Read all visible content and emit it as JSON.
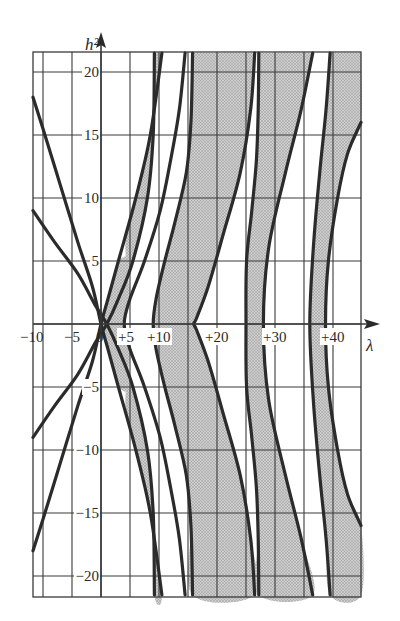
{
  "chart_data": {
    "type": "line",
    "title": "",
    "xlabel": "λ",
    "ylabel": "h²",
    "xlim": [
      -12,
      45
    ],
    "ylim": [
      -21.5,
      21.5
    ],
    "grid": true,
    "legend": null,
    "x_ticks": [
      -10,
      -5,
      0,
      5,
      10,
      15,
      20,
      25,
      30,
      35,
      40
    ],
    "x_tick_labels": [
      "−10",
      "−5",
      "0",
      "+5",
      "+10",
      "",
      "+20",
      "",
      "+30",
      "",
      "+40"
    ],
    "y_ticks": [
      -20,
      -15,
      -10,
      -5,
      0,
      5,
      10,
      15,
      20
    ],
    "y_tick_labels": [
      "−20",
      "−15",
      "−10",
      "−5",
      "",
      "5",
      "10",
      "15",
      "20"
    ],
    "shading": "stable regions (stippled gray) between paired characteristic curves",
    "fill_color": "#bdbdbd",
    "line_color": "#2b2b2b",
    "stable_regions": [
      {
        "name": "region-0-1",
        "left": [
          [
            1.2,
            0
          ],
          [
            2.2,
            5
          ],
          [
            4.5,
            10
          ]
        ],
        "right": [
          [
            1.2,
            0
          ],
          [
            2.6,
            -5
          ],
          [
            5.5,
            -10
          ]
        ]
      },
      {
        "name": "region-1-4",
        "note": "between a1/b1 and b2/a2 curves"
      },
      {
        "name": "region-4-9"
      },
      {
        "name": "region-9-16"
      },
      {
        "name": "region-16-25"
      }
    ],
    "series": [
      {
        "name": "a0",
        "points": [
          [
            -12,
            18
          ],
          [
            -10,
            15.5
          ],
          [
            -7,
            11
          ],
          [
            -4,
            6.5
          ],
          [
            -1.5,
            3
          ],
          [
            0,
            0
          ],
          [
            1.2,
            -2
          ],
          [
            3,
            -5
          ],
          [
            6,
            -10
          ],
          [
            8.5,
            -15
          ],
          [
            10.5,
            -21.5
          ]
        ]
      },
      {
        "name": "a0-mirror",
        "points": [
          [
            -12,
            -18
          ],
          [
            -10,
            -15.5
          ],
          [
            -7,
            -11
          ],
          [
            -4,
            -6.5
          ],
          [
            -1.5,
            -3
          ],
          [
            0,
            0
          ],
          [
            1.2,
            2
          ],
          [
            3,
            5
          ],
          [
            6,
            10
          ],
          [
            8.5,
            15
          ],
          [
            10.5,
            21.5
          ]
        ]
      },
      {
        "name": "b1",
        "points": [
          [
            -12,
            9
          ],
          [
            -8,
            6.5
          ],
          [
            -4,
            4
          ],
          [
            -1,
            1.5
          ],
          [
            1,
            0
          ],
          [
            3,
            -2
          ],
          [
            5.5,
            -5
          ],
          [
            8,
            -10
          ],
          [
            9,
            -15
          ],
          [
            9.2,
            -21.5
          ]
        ]
      },
      {
        "name": "a1",
        "points": [
          [
            -12,
            -9
          ],
          [
            -8,
            -6.5
          ],
          [
            -4,
            -4
          ],
          [
            -1,
            -1.5
          ],
          [
            1,
            0
          ],
          [
            3,
            2
          ],
          [
            5.5,
            5
          ],
          [
            8,
            10
          ],
          [
            9,
            15
          ],
          [
            9.2,
            21.5
          ]
        ]
      },
      {
        "name": "b2",
        "points": [
          [
            14.5,
            21.5
          ],
          [
            13.5,
            17
          ],
          [
            12,
            13
          ],
          [
            10.2,
            9
          ],
          [
            7.5,
            5
          ],
          [
            5,
            2
          ],
          [
            4,
            0
          ],
          [
            5,
            -2
          ],
          [
            7.5,
            -5
          ],
          [
            10.2,
            -9
          ],
          [
            12,
            -13
          ],
          [
            13.5,
            -17
          ],
          [
            14.5,
            -21.5
          ]
        ]
      },
      {
        "name": "a2",
        "points": [
          [
            15.8,
            21.5
          ],
          [
            15.5,
            16
          ],
          [
            14.7,
            12
          ],
          [
            12.7,
            8
          ],
          [
            11,
            5
          ],
          [
            9.5,
            2
          ],
          [
            9,
            0
          ],
          [
            9.5,
            -2
          ],
          [
            11,
            -5
          ],
          [
            12.7,
            -8
          ],
          [
            14.7,
            -12
          ],
          [
            15.5,
            -16
          ],
          [
            15.8,
            -21.5
          ]
        ]
      },
      {
        "name": "b3",
        "points": [
          [
            26.5,
            21.5
          ],
          [
            25.8,
            17
          ],
          [
            24,
            12
          ],
          [
            21,
            7
          ],
          [
            18.5,
            3
          ],
          [
            16.5,
            0.5
          ],
          [
            16,
            0
          ],
          [
            16.5,
            -0.5
          ],
          [
            18.5,
            -3
          ],
          [
            21,
            -7
          ],
          [
            24,
            -12
          ],
          [
            25.8,
            -17
          ],
          [
            26.5,
            -21.5
          ]
        ]
      },
      {
        "name": "a3",
        "points": [
          [
            27.2,
            21.5
          ],
          [
            27.1,
            17
          ],
          [
            26.8,
            13
          ],
          [
            26,
            9
          ],
          [
            25.1,
            5
          ],
          [
            25,
            0
          ],
          [
            25.1,
            -5
          ],
          [
            26,
            -9
          ],
          [
            26.8,
            -13
          ],
          [
            27.1,
            -17
          ],
          [
            27.2,
            -21.5
          ]
        ]
      },
      {
        "name": "b4",
        "points": [
          [
            36.5,
            21.5
          ],
          [
            34.5,
            17
          ],
          [
            31.8,
            12
          ],
          [
            28.9,
            6
          ],
          [
            28,
            0
          ],
          [
            28.9,
            -6
          ],
          [
            31.8,
            -12
          ],
          [
            34.5,
            -17
          ],
          [
            36.5,
            -21.5
          ]
        ]
      },
      {
        "name": "a4",
        "points": [
          [
            39.5,
            21.5
          ],
          [
            38.8,
            17
          ],
          [
            37.7,
            12
          ],
          [
            36.6,
            6
          ],
          [
            36,
            0
          ],
          [
            36.6,
            -6
          ],
          [
            37.7,
            -12
          ],
          [
            38.8,
            -17
          ],
          [
            39.5,
            -21.5
          ]
        ]
      },
      {
        "name": "b5",
        "points": [
          [
            45,
            16
          ],
          [
            42.5,
            13.5
          ],
          [
            40.8,
            10
          ],
          [
            39.2,
            5
          ],
          [
            38.7,
            0
          ],
          [
            39.2,
            -5
          ],
          [
            40.8,
            -10
          ],
          [
            42.5,
            -13.5
          ],
          [
            45,
            -16
          ]
        ]
      }
    ],
    "fills": [
      {
        "name": "fill-1",
        "left": "a0-mirror",
        "right": "a1",
        "polygon": [
          [
            0,
            0
          ],
          [
            1.2,
            2
          ],
          [
            3,
            5
          ],
          [
            5.5,
            5
          ],
          [
            3,
            2
          ],
          [
            1,
            0
          ],
          [
            3,
            -2
          ],
          [
            5.5,
            -5
          ],
          [
            3,
            -5
          ],
          [
            1.2,
            -2
          ]
        ]
      },
      {
        "name": "fill-2",
        "polygon": [
          [
            9.2,
            21.5
          ],
          [
            9,
            15
          ],
          [
            8,
            10
          ],
          [
            5.5,
            5
          ],
          [
            3,
            2
          ],
          [
            1,
            0
          ],
          [
            3,
            -2
          ],
          [
            5.5,
            -5
          ],
          [
            8,
            -10
          ],
          [
            9,
            -15
          ],
          [
            9.2,
            -21.5
          ],
          [
            10.5,
            -21.5
          ],
          [
            8.5,
            -15
          ],
          [
            6,
            -10
          ],
          [
            4.2,
            -6.5
          ],
          [
            5,
            -2
          ],
          [
            4,
            0
          ],
          [
            5,
            2
          ],
          [
            4.2,
            6.5
          ],
          [
            6,
            10
          ],
          [
            8.5,
            15
          ],
          [
            10.5,
            21.5
          ]
        ]
      },
      {
        "name": "fill-3",
        "polygon": [
          [
            15.8,
            21.5
          ],
          [
            15.5,
            16
          ],
          [
            14.7,
            12
          ],
          [
            12.7,
            8
          ],
          [
            11,
            5
          ],
          [
            9.5,
            2
          ],
          [
            9,
            0
          ],
          [
            9.5,
            -2
          ],
          [
            11,
            -5
          ],
          [
            12.7,
            -8
          ],
          [
            14.7,
            -12
          ],
          [
            15.5,
            -16
          ],
          [
            15.8,
            -21.5
          ],
          [
            26.5,
            -21.5
          ],
          [
            25.8,
            -17
          ],
          [
            24,
            -12
          ],
          [
            21,
            -7
          ],
          [
            18.5,
            -3
          ],
          [
            16.5,
            -0.5
          ],
          [
            16,
            0
          ],
          [
            16.5,
            0.5
          ],
          [
            18.5,
            3
          ],
          [
            21,
            7
          ],
          [
            24,
            12
          ],
          [
            25.8,
            17
          ],
          [
            26.5,
            21.5
          ]
        ]
      },
      {
        "name": "fill-4",
        "polygon": [
          [
            27.2,
            21.5
          ],
          [
            27.1,
            17
          ],
          [
            26.8,
            13
          ],
          [
            26,
            9
          ],
          [
            25.1,
            5
          ],
          [
            25,
            0
          ],
          [
            25.1,
            -5
          ],
          [
            26,
            -9
          ],
          [
            26.8,
            -13
          ],
          [
            27.1,
            -17
          ],
          [
            27.2,
            -21.5
          ],
          [
            36.5,
            -21.5
          ],
          [
            34.5,
            -17
          ],
          [
            31.8,
            -12
          ],
          [
            28.9,
            -6
          ],
          [
            28,
            0
          ],
          [
            28.9,
            6
          ],
          [
            31.8,
            12
          ],
          [
            34.5,
            17
          ],
          [
            36.5,
            21.5
          ]
        ]
      },
      {
        "name": "fill-5",
        "polygon": [
          [
            39.5,
            21.5
          ],
          [
            38.8,
            17
          ],
          [
            37.7,
            12
          ],
          [
            36.6,
            6
          ],
          [
            36,
            0
          ],
          [
            36.6,
            -6
          ],
          [
            37.7,
            -12
          ],
          [
            38.8,
            -17
          ],
          [
            39.5,
            -21.5
          ],
          [
            45,
            -21.5
          ],
          [
            45,
            -16
          ],
          [
            42.5,
            -13.5
          ],
          [
            40.8,
            -10
          ],
          [
            39.2,
            -5
          ],
          [
            38.7,
            0
          ],
          [
            39.2,
            5
          ],
          [
            40.8,
            10
          ],
          [
            42.5,
            13.5
          ],
          [
            45,
            16
          ],
          [
            45,
            21.5
          ]
        ]
      }
    ]
  },
  "layout": {
    "x0_px": 101,
    "x_scale": 5.8,
    "y0_px": 324,
    "y_scale": 12.6,
    "plot_left": 33,
    "plot_right": 361,
    "plot_top": 52,
    "plot_bottom": 597
  }
}
